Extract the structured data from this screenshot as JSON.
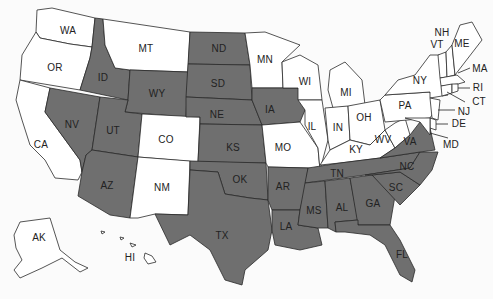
{
  "map": {
    "type": "choropleth",
    "region": "United States",
    "colors": {
      "shaded": "#6f6f6f",
      "unshaded": "#ffffff",
      "border": "#2a2a2a"
    },
    "shaded_states": [
      "ID",
      "NV",
      "UT",
      "AZ",
      "WY",
      "ND",
      "SD",
      "NE",
      "KS",
      "OK",
      "TX",
      "IA",
      "AR",
      "LA",
      "MS",
      "AL",
      "TN",
      "GA",
      "SC",
      "NC",
      "VA",
      "FL"
    ],
    "unshaded_states": [
      "WA",
      "OR",
      "CA",
      "MT",
      "CO",
      "NM",
      "MN",
      "WI",
      "MI",
      "IL",
      "IN",
      "OH",
      "KY",
      "WV",
      "MO",
      "PA",
      "NY",
      "NJ",
      "DE",
      "MD",
      "CT",
      "RI",
      "MA",
      "VT",
      "NH",
      "ME",
      "AK",
      "HI"
    ]
  },
  "labels": {
    "WA": "WA",
    "OR": "OR",
    "CA": "CA",
    "ID": "ID",
    "NV": "NV",
    "MT": "MT",
    "WY": "WY",
    "UT": "UT",
    "AZ": "AZ",
    "CO": "CO",
    "NM": "NM",
    "ND": "ND",
    "SD": "SD",
    "NE": "NE",
    "KS": "KS",
    "OK": "OK",
    "TX": "TX",
    "MN": "MN",
    "IA": "IA",
    "MO": "MO",
    "AR": "AR",
    "LA": "LA",
    "WI": "WI",
    "IL": "IL",
    "MI": "MI",
    "IN": "IN",
    "OH": "OH",
    "KY": "KY",
    "TN": "TN",
    "MS": "MS",
    "AL": "AL",
    "GA": "GA",
    "FL": "FL",
    "SC": "SC",
    "NC": "NC",
    "VA": "VA",
    "WV": "WV",
    "PA": "PA",
    "NY": "NY",
    "VT": "VT",
    "NH": "NH",
    "ME": "ME",
    "MA": "MA",
    "RI": "RI",
    "CT": "CT",
    "NJ": "NJ",
    "DE": "DE",
    "MD": "MD",
    "AK": "AK",
    "HI": "HI"
  }
}
